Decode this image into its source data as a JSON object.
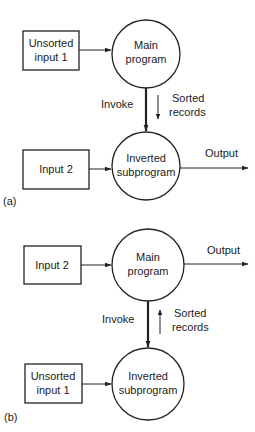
{
  "panels": [
    {
      "tag": "(a)",
      "top_box": [
        "Unsorted",
        "input 1"
      ],
      "top_circle": [
        "Main",
        "program"
      ],
      "bottom_box": [
        "Input 2"
      ],
      "bottom_circle": [
        "Inverted",
        "subprogram"
      ],
      "invoke_label": "Invoke",
      "sorted_label": [
        "Sorted",
        "records"
      ],
      "output_label": "Output"
    },
    {
      "tag": "(b)",
      "top_box": [
        "Input 2"
      ],
      "top_circle": [
        "Main",
        "program"
      ],
      "bottom_box": [
        "Unsorted",
        "input 1"
      ],
      "bottom_circle": [
        "Inverted",
        "subprogram"
      ],
      "invoke_label": "Invoke",
      "sorted_label": [
        "Sorted",
        "records"
      ],
      "output_label": "Output"
    }
  ]
}
